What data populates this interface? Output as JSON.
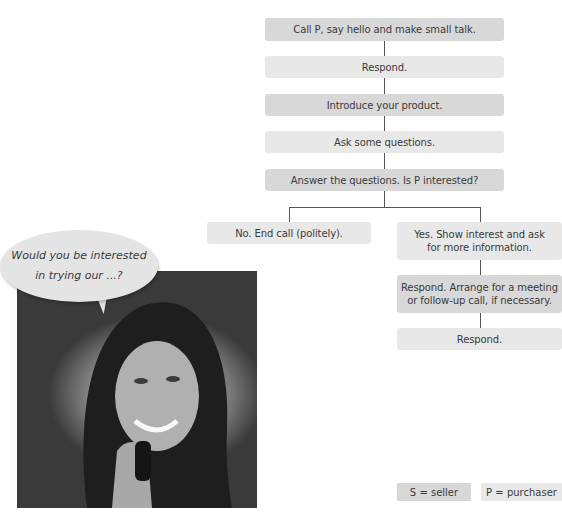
{
  "flowchart": {
    "steps": [
      {
        "text": "Call P, say hello and make small talk.",
        "role": "S"
      },
      {
        "text": "Respond.",
        "role": "P"
      },
      {
        "text": "Introduce your product.",
        "role": "S"
      },
      {
        "text": "Ask some questions.",
        "role": "P"
      },
      {
        "text": "Answer the questions. Is P interested?",
        "role": "S"
      }
    ],
    "branch_no": {
      "text": "No. End call (politely).",
      "role": "P"
    },
    "branch_yes": [
      {
        "line1": "Yes. Show interest and ask",
        "line2": "for more information.",
        "role": "P"
      },
      {
        "line1": "Respond. Arrange for a meeting",
        "line2": "or follow-up call, if necessary.",
        "role": "S"
      },
      {
        "text": "Respond.",
        "role": "P"
      }
    ]
  },
  "speech_bubble": {
    "line1": "Would you be interested",
    "line2": "in trying our ...?"
  },
  "photo": {
    "description": "Smiling woman talking on a phone"
  },
  "legend": [
    {
      "text": "S = seller"
    },
    {
      "text": "P = purchaser"
    }
  ],
  "colors": {
    "seller_box": "#d8d8d8",
    "purchaser_box": "#e8e8e8",
    "connector": "#555555"
  }
}
